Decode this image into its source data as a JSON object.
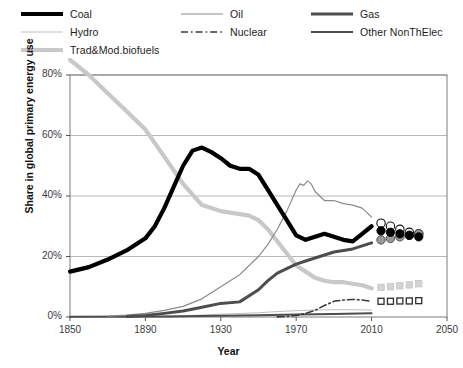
{
  "legend": {
    "entries": [
      {
        "label": "Coal",
        "key": "coal",
        "color": "#000000",
        "width": 4.2,
        "dash": "none",
        "col": 0,
        "row": 0
      },
      {
        "label": "Oil",
        "key": "oil",
        "color": "#8a8a8a",
        "width": 1.2,
        "dash": "none",
        "col": 1,
        "row": 0
      },
      {
        "label": "Gas",
        "key": "gas",
        "color": "#4d4d4d",
        "width": 3.0,
        "dash": "none",
        "col": 2,
        "row": 0
      },
      {
        "label": "Hydro",
        "key": "hydro",
        "color": "#bfbfbf",
        "width": 1.0,
        "dash": "none",
        "col": 0,
        "row": 1
      },
      {
        "label": "Nuclear",
        "key": "nuclear",
        "color": "#3a3a3a",
        "width": 1.6,
        "dash": "dashdot",
        "col": 1,
        "row": 1
      },
      {
        "label": "Other NonThElec",
        "key": "other",
        "color": "#4d4d4d",
        "width": 2.0,
        "dash": "none",
        "col": 2,
        "row": 1
      },
      {
        "label": "Trad&Mod.biofuels",
        "key": "biofuels",
        "color": "#c8c8c8",
        "width": 4.2,
        "dash": "none",
        "col": 0,
        "row": 2
      }
    ]
  },
  "chart_data": {
    "type": "line",
    "title": "",
    "xlabel": "Year",
    "ylabel": "Share in global primary energy use",
    "xlim": [
      1850,
      2050
    ],
    "ylim": [
      0,
      80
    ],
    "xticks": [
      1850,
      1890,
      1930,
      1970,
      2010,
      2050
    ],
    "xtick_labels": [
      "1850",
      "1890",
      "1930",
      "1970",
      "2010",
      "2050"
    ],
    "yticks": [
      0,
      20,
      40,
      60,
      80
    ],
    "ytick_labels": [
      "0%",
      "20%",
      "40%",
      "60%",
      "80%"
    ],
    "grid": "horizontal",
    "legend_position": "above-plot",
    "series": [
      {
        "name": "Coal",
        "key": "coal",
        "color": "#000000",
        "width": 4.2,
        "dash": "none",
        "x": [
          1850,
          1860,
          1870,
          1880,
          1890,
          1895,
          1900,
          1905,
          1910,
          1915,
          1920,
          1925,
          1930,
          1935,
          1940,
          1945,
          1950,
          1955,
          1960,
          1965,
          1970,
          1975,
          1980,
          1985,
          1990,
          1995,
          2000,
          2005,
          2010
        ],
        "values": [
          15,
          16.5,
          19,
          22,
          26,
          30,
          36,
          43,
          50,
          55,
          56,
          54.5,
          52.5,
          50,
          49,
          49,
          47,
          42,
          37,
          32,
          27,
          25.5,
          26.5,
          27.5,
          26.5,
          25.5,
          25,
          27.5,
          30
        ],
        "marker_x": [
          2015,
          2020,
          2025,
          2030,
          2035
        ],
        "marker_values": [
          28.5,
          28,
          27.5,
          27,
          26.5
        ],
        "marker": "filled-circle",
        "marker_color": "#000000"
      },
      {
        "name": "Oil",
        "key": "oil",
        "color": "#8a8a8a",
        "width": 1.2,
        "dash": "none",
        "x": [
          1870,
          1880,
          1890,
          1900,
          1910,
          1920,
          1930,
          1940,
          1950,
          1955,
          1960,
          1965,
          1970,
          1972,
          1974,
          1976,
          1978,
          1980,
          1985,
          1990,
          1995,
          2000,
          2005,
          2010
        ],
        "values": [
          0.3,
          0.6,
          1.2,
          2.2,
          3.5,
          6,
          10,
          14,
          20,
          24,
          29,
          35,
          42,
          44,
          43.5,
          45,
          44,
          41.5,
          38.5,
          38.5,
          37.5,
          37,
          36,
          33
        ],
        "marker_x": [
          2015,
          2020,
          2025,
          2030,
          2035
        ],
        "marker_values": [
          31,
          30,
          29,
          28,
          27.5
        ],
        "marker": "open-circle",
        "marker_color": "#ffffff"
      },
      {
        "name": "Gas",
        "key": "gas",
        "color": "#4d4d4d",
        "width": 3.0,
        "dash": "none",
        "x": [
          1880,
          1890,
          1900,
          1910,
          1920,
          1930,
          1940,
          1950,
          1955,
          1960,
          1965,
          1970,
          1975,
          1980,
          1985,
          1990,
          1995,
          2000,
          2005,
          2010
        ],
        "values": [
          0.2,
          0.5,
          1.2,
          2,
          3.2,
          4.5,
          5,
          9,
          12,
          14.5,
          16,
          17.5,
          18.5,
          19.5,
          20.5,
          21.5,
          22,
          22.5,
          23.5,
          24.5
        ],
        "marker_x": [
          2015,
          2020,
          2025,
          2030,
          2035
        ],
        "marker_values": [
          25.5,
          26,
          26.5,
          27,
          27.5
        ],
        "marker": "gray-circle",
        "marker_color": "#9a9a9a"
      },
      {
        "name": "Trad&Mod.biofuels",
        "key": "biofuels",
        "color": "#c8c8c8",
        "width": 4.2,
        "dash": "none",
        "x": [
          1850,
          1860,
          1870,
          1880,
          1890,
          1900,
          1910,
          1920,
          1925,
          1930,
          1935,
          1940,
          1945,
          1950,
          1955,
          1960,
          1965,
          1970,
          1975,
          1980,
          1985,
          1990,
          1995,
          2000,
          2005,
          2010
        ],
        "values": [
          85,
          80,
          74,
          68,
          62,
          53,
          44,
          37,
          36,
          35,
          34.5,
          34,
          33.5,
          32,
          29,
          25,
          21,
          17,
          15,
          13,
          12,
          11.5,
          11.5,
          11,
          10.5,
          9.5
        ],
        "marker_x": [
          2015,
          2020,
          2025,
          2030,
          2035
        ],
        "marker_values": [
          9.8,
          10,
          10.3,
          10.6,
          11
        ],
        "marker": "light-square",
        "marker_color": "#d4d4d4"
      },
      {
        "name": "Other NonThElec",
        "key": "other",
        "color": "#4d4d4d",
        "width": 2.0,
        "dash": "none",
        "x": [
          1850,
          1900,
          1930,
          1950,
          1970,
          1990,
          2010
        ],
        "values": [
          0.1,
          0.2,
          0.4,
          0.6,
          0.8,
          1.0,
          1.2
        ],
        "marker_x": [],
        "marker_values": [],
        "marker": "none",
        "marker_color": "#4d4d4d"
      },
      {
        "name": "Hydro",
        "key": "hydro",
        "color": "#bfbfbf",
        "width": 1.0,
        "dash": "none",
        "x": [
          1890,
          1910,
          1930,
          1950,
          1960,
          1970,
          1980,
          1990,
          2000,
          2010
        ],
        "values": [
          0.1,
          0.4,
          0.9,
          1.4,
          1.8,
          2.1,
          2.3,
          2.4,
          2.4,
          2.3
        ],
        "marker_x": [],
        "marker_values": [],
        "marker": "none",
        "marker_color": "#bfbfbf"
      },
      {
        "name": "Nuclear",
        "key": "nuclear",
        "color": "#3a3a3a",
        "width": 1.6,
        "dash": "dashdot",
        "x": [
          1960,
          1965,
          1970,
          1975,
          1980,
          1985,
          1990,
          1995,
          2000,
          2005,
          2010
        ],
        "values": [
          0.05,
          0.2,
          0.5,
          1.2,
          2.2,
          3.8,
          5.2,
          5.6,
          5.8,
          5.6,
          5.2
        ],
        "marker_x": [
          2015,
          2020,
          2025,
          2030,
          2035
        ],
        "marker_values": [
          5.2,
          5.2,
          5.3,
          5.3,
          5.4
        ],
        "marker": "small-square",
        "marker_color": "#2b2b2b"
      }
    ]
  }
}
